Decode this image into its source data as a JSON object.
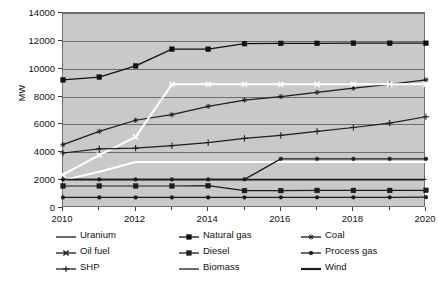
{
  "chart_data": {
    "type": "line",
    "title": "",
    "xlabel": "",
    "ylabel": "MW",
    "xlim": [
      2010,
      2020
    ],
    "ylim": [
      0,
      14000
    ],
    "grid": true,
    "legend_position": "bottom",
    "plot_background": "#c9c9c9",
    "x": [
      2010,
      2011,
      2012,
      2013,
      2014,
      2015,
      2016,
      2017,
      2018,
      2019,
      2020
    ],
    "xticks": [
      2010,
      2012,
      2014,
      2016,
      2018,
      2020
    ],
    "xtick_labels": [
      "2010",
      "2012",
      "2014",
      "2016",
      "2018",
      "2020"
    ],
    "xminor_ticks": [
      2011,
      2013,
      2015,
      2017,
      2019
    ],
    "yticks": [
      0,
      2000,
      4000,
      6000,
      8000,
      10000,
      12000,
      14000
    ],
    "ytick_labels": [
      "0",
      "2000",
      "4000",
      "6000",
      "8000",
      "10000",
      "12000",
      "14000"
    ],
    "series": [
      {
        "name": "Uranium",
        "marker": "none",
        "color": "#1d1d1d",
        "width": 1.2,
        "values": [
          2050,
          2050,
          2050,
          2050,
          2050,
          2050,
          2050,
          2050,
          2050,
          2050,
          2050
        ]
      },
      {
        "name": "Natural gas",
        "marker": "square",
        "color": "#111111",
        "width": 1.3,
        "values": [
          9200,
          9400,
          10200,
          11400,
          11400,
          11800,
          11820,
          11820,
          11830,
          11830,
          11830
        ]
      },
      {
        "name": "Coal",
        "marker": "star",
        "color": "#1d1d1d",
        "width": 1.2,
        "values": [
          4550,
          5500,
          6300,
          6700,
          7300,
          7750,
          8000,
          8300,
          8600,
          8880,
          9200
        ]
      },
      {
        "name": "Oil fuel",
        "marker": "cross",
        "color": "#ffffff",
        "width": 2.0,
        "values": [
          2400,
          3800,
          5100,
          8880,
          8880,
          8880,
          8880,
          8880,
          8880,
          8880,
          8880
        ]
      },
      {
        "name": "Diesel",
        "marker": "square",
        "color": "#1d1d1d",
        "width": 1.2,
        "values": [
          1580,
          1580,
          1580,
          1580,
          1600,
          1250,
          1250,
          1260,
          1260,
          1260,
          1270
        ]
      },
      {
        "name": "Process gas",
        "marker": "dot",
        "color": "#1d1d1d",
        "width": 1.2,
        "values": [
          760,
          760,
          760,
          760,
          760,
          760,
          770,
          770,
          770,
          770,
          780
        ]
      },
      {
        "name": "SHP",
        "marker": "plus",
        "color": "#1d1d1d",
        "width": 1.2,
        "values": [
          3950,
          4250,
          4300,
          4480,
          4700,
          5000,
          5220,
          5500,
          5780,
          6100,
          6550
        ]
      },
      {
        "name": "Biomass",
        "marker": "none",
        "color": "#ffffff",
        "width": 2.0,
        "values": [
          2000,
          2600,
          3300,
          3300,
          3300,
          3300,
          3300,
          3300,
          3300,
          3300,
          3300
        ]
      },
      {
        "name": "Wind",
        "marker": "dot",
        "color": "#1d1d1d",
        "width": 1.3,
        "values": [
          2050,
          2050,
          2050,
          2050,
          2050,
          2060,
          3530,
          3530,
          3530,
          3530,
          3530
        ]
      }
    ]
  },
  "legend": {
    "rows": [
      [
        {
          "name": "Uranium",
          "marker": "none",
          "color": "#1d1d1d"
        },
        {
          "name": "Natural gas",
          "marker": "square",
          "color": "#111111"
        },
        {
          "name": "Coal",
          "marker": "star",
          "color": "#1d1d1d"
        }
      ],
      [
        {
          "name": "Oil fuel",
          "marker": "cross",
          "color": "#1d1d1d"
        },
        {
          "name": "Diesel",
          "marker": "square",
          "color": "#1d1d1d"
        },
        {
          "name": "Process gas",
          "marker": "dot",
          "color": "#1d1d1d"
        }
      ],
      [
        {
          "name": "SHP",
          "marker": "plus",
          "color": "#1d1d1d"
        },
        {
          "name": "Biomass",
          "marker": "none",
          "color": "#1d1d1d"
        },
        {
          "name": "Wind",
          "marker": "thick",
          "color": "#1d1d1d"
        }
      ]
    ]
  }
}
